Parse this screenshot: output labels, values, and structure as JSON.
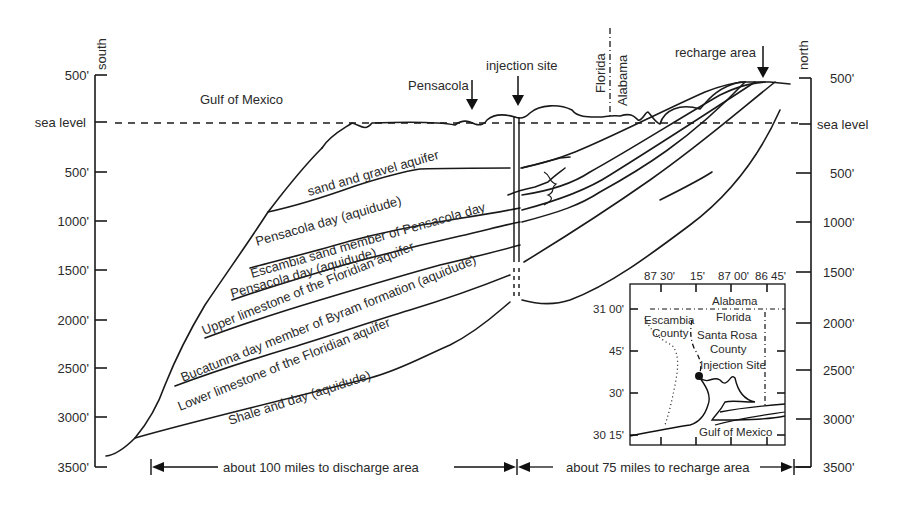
{
  "axes": {
    "left": {
      "direction": "south",
      "ticks": [
        "500'",
        "sea level",
        "500'",
        "1000'",
        "1500'",
        "2000'",
        "2500'",
        "3000'",
        "3500'"
      ]
    },
    "right": {
      "direction": "north",
      "ticks": [
        "500'",
        "sea level",
        "500'",
        "1000'",
        "1500'",
        "2000'",
        "2500'",
        "3000'",
        "3500'"
      ]
    }
  },
  "surface_labels": {
    "gulf": "Gulf of Mexico",
    "pensacola": "Pensacola",
    "injection_site": "injection site",
    "florida": "Florida",
    "alabama": "Alabama",
    "recharge_area": "recharge area"
  },
  "layers": [
    {
      "label": "sand and gravel aquifer"
    },
    {
      "label": "Pensacola day (aquidude)"
    },
    {
      "label": "Escambia sand member of Pensacola day"
    },
    {
      "label": "Pensacola day (aquidude)"
    },
    {
      "label": "Upper limestone of the Floridian aquifer"
    },
    {
      "label": "Bucatunna day member of Byram formation (aquidude)"
    },
    {
      "label": "Lower limestone of the Floridian aquifer"
    },
    {
      "label": "Shale and day (aquidude)"
    }
  ],
  "distances": {
    "discharge": "about 100 miles to discharge area",
    "recharge": "about 75 miles to recharge area"
  },
  "inset_map": {
    "lon_ticks": [
      "87 30'",
      "15'",
      "87 00'",
      "86 45'"
    ],
    "lat_ticks": [
      "31 00'",
      "45'",
      "30'",
      "30 15'"
    ],
    "labels": {
      "alabama": "Alabama",
      "florida": "Florida",
      "escambia_1": "Escambia",
      "escambia_2": "County",
      "santa_rosa_1": "Santa Rosa",
      "santa_rosa_2": "County",
      "injection_site": "Injection Site",
      "gulf": "Gulf of Mexico"
    }
  }
}
